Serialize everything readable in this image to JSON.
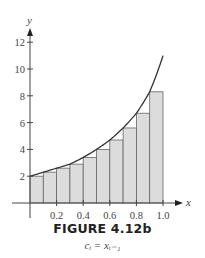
{
  "chart_data": {
    "type": "bar",
    "title": "FIGURE 4.12b",
    "subtitle": "c_i = x_{i-1}",
    "xlabel": "x",
    "ylabel": "y",
    "xlim": [
      0,
      1.0
    ],
    "ylim": [
      0,
      12
    ],
    "x_ticks": [
      "0.2",
      "0.4",
      "0.6",
      "0.8",
      "1.0"
    ],
    "y_ticks": [
      "2",
      "4",
      "6",
      "8",
      "10",
      "12"
    ],
    "grid": false,
    "legend": null,
    "bar_width": 0.1,
    "categories": [
      "0.0",
      "0.1",
      "0.2",
      "0.3",
      "0.4",
      "0.5",
      "0.6",
      "0.7",
      "0.8",
      "0.9"
    ],
    "values": [
      2.0,
      2.3,
      2.6,
      2.9,
      3.4,
      4.0,
      4.7,
      5.6,
      6.7,
      8.3
    ],
    "curve": {
      "description": "increasing curve f(x) from (0,2) to (1,~11)",
      "x": [
        0.0,
        0.1,
        0.2,
        0.3,
        0.4,
        0.5,
        0.6,
        0.7,
        0.8,
        0.9,
        1.0
      ],
      "y": [
        2.0,
        2.3,
        2.6,
        2.9,
        3.4,
        4.0,
        4.7,
        5.6,
        6.7,
        8.3,
        11.0
      ]
    },
    "colors": {
      "bar_fill": "#dcdcdc",
      "bar_stroke": "#666666",
      "curve": "#333333",
      "axis": "#444444"
    }
  },
  "figure": {
    "title": "FIGURE 4.12b",
    "caption": "cᵢ = xᵢ₋₁"
  }
}
